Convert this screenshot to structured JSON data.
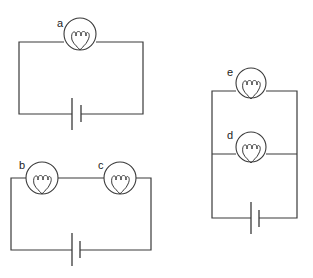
{
  "diagram": {
    "type": "electric-circuits",
    "circuits": [
      {
        "id": "circuit-1",
        "configuration": "single bulb",
        "bulbs": [
          {
            "label": "a"
          }
        ],
        "battery": {
          "cells": 1
        }
      },
      {
        "id": "circuit-2",
        "configuration": "two bulbs in series",
        "bulbs": [
          {
            "label": "b"
          },
          {
            "label": "c"
          }
        ],
        "battery": {
          "cells": 1
        }
      },
      {
        "id": "circuit-3",
        "configuration": "two bulbs in parallel",
        "bulbs": [
          {
            "label": "e"
          },
          {
            "label": "d"
          }
        ],
        "battery": {
          "cells": 1
        }
      }
    ],
    "colors": {
      "line": "#3a3a3a",
      "background": "#ffffff"
    }
  }
}
